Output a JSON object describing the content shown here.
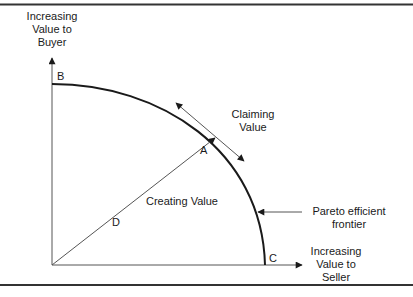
{
  "diagram": {
    "axes": {
      "y_label": [
        "Increasing",
        "Value to",
        "Buyer"
      ],
      "x_label": [
        "Increasing",
        "Value to",
        "Seller"
      ]
    },
    "points": {
      "A": "A",
      "B": "B",
      "C": "C",
      "D": "D"
    },
    "annotations": {
      "claiming": [
        "Claiming",
        "Value"
      ],
      "creating": "Creating Value",
      "frontier": [
        "Pareto efficient",
        "frontier"
      ]
    },
    "colors": {
      "line": "#1a1a1a",
      "thin_line": "#555555",
      "border": "#333333",
      "background": "#ffffff"
    }
  }
}
